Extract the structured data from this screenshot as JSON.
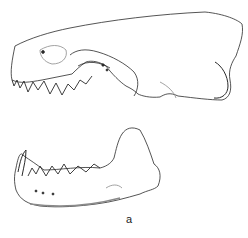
{
  "figure": {
    "panel_label": "a",
    "parts": [
      "cranium-lateral-view",
      "mandible-lateral-view"
    ],
    "colors": {
      "ink": "#2a2a2a",
      "shade": "#8a8a8a",
      "background": "#ffffff"
    }
  }
}
